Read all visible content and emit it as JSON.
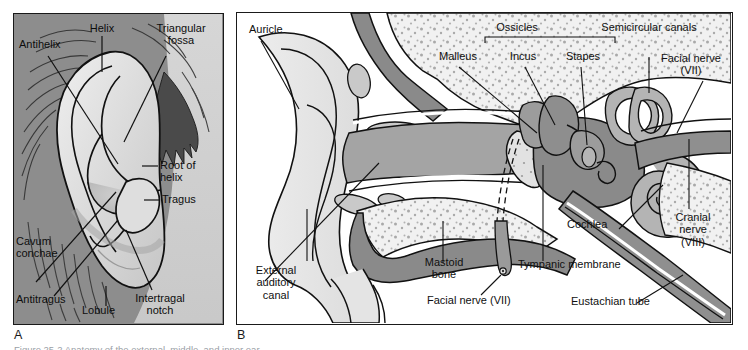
{
  "figure": {
    "caption": "Figure 25-2  Anatomy of the external, middle, and inner ear.",
    "panels": [
      {
        "letter": "A",
        "title": "External ear (auricle) surface anatomy"
      },
      {
        "letter": "B",
        "title": "Cross section of external, middle, and inner ear"
      }
    ]
  },
  "panel_a": {
    "letter": "A",
    "labels": [
      {
        "id": "antihelix",
        "text": "Antihelix"
      },
      {
        "id": "helix",
        "text": "Helix"
      },
      {
        "id": "triangular-fossa",
        "text": "Triangular\nfossa"
      },
      {
        "id": "root-of-helix",
        "text": "Root of\nhelix"
      },
      {
        "id": "tragus",
        "text": "Tragus"
      },
      {
        "id": "cavum-conchae",
        "text": "Cavum\nconchae"
      },
      {
        "id": "antitragus",
        "text": "Antitragus"
      },
      {
        "id": "lobule",
        "text": "Lobule"
      },
      {
        "id": "intertragal-notch",
        "text": "Intertragal\nnotch"
      }
    ]
  },
  "panel_b": {
    "letter": "B",
    "bracket_label": "Ossicles",
    "labels": [
      {
        "id": "auricle",
        "text": "Auricle"
      },
      {
        "id": "ossicles",
        "text": "Ossicles"
      },
      {
        "id": "malleus",
        "text": "Malleus"
      },
      {
        "id": "incus",
        "text": "Incus"
      },
      {
        "id": "stapes",
        "text": "Stapes"
      },
      {
        "id": "semicircular-canals",
        "text": "Semicircular canals"
      },
      {
        "id": "facial-nerve-vii-top",
        "text": "Facial nerve\n(VII)"
      },
      {
        "id": "cranial-nerve-viii",
        "text": "Cranial\nnerve\n(VIII)"
      },
      {
        "id": "cochlea",
        "text": "Cochlea"
      },
      {
        "id": "tympanic-membrane",
        "text": "Tympanic membrane"
      },
      {
        "id": "eustachian-tube",
        "text": "Eustachian tube"
      },
      {
        "id": "mastoid-bone",
        "text": "Mastoid\nbone"
      },
      {
        "id": "facial-nerve-vii",
        "text": "Facial nerve (VII)"
      },
      {
        "id": "external-auditory-canal",
        "text": "External\nauditory\ncanal"
      }
    ]
  },
  "colors": {
    "panel_a_background": "#8d8d8d",
    "panel_a_skin_light": "#d7d7d7",
    "panel_a_ear_highlight": "#e3e3e3",
    "panel_a_shadow": "#b0b0b0",
    "panel_b_background": "#ffffff",
    "bone_fill": "#f0f0f0",
    "bone_stipple": "#a8a8a8",
    "cartilage_fill": "#d5d5d5",
    "canal_fill": "#a9a9a9",
    "nerve_fill": "#8f8f8f",
    "dark_tissue": "#8a8a8a",
    "outline": "#111111",
    "text": "#101010"
  }
}
